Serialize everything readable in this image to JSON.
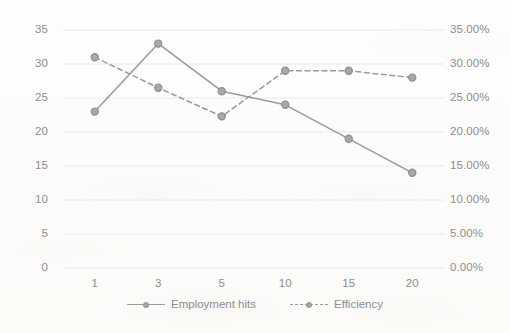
{
  "chart_data": {
    "type": "line",
    "title": "",
    "xlabel": "",
    "ylabel": "",
    "categories": [
      "1",
      "3",
      "5",
      "10",
      "15",
      "20"
    ],
    "series": [
      {
        "name": "Employment hits",
        "axis": "left",
        "style": "solid",
        "marker": "circle",
        "color": "#9a9a9a",
        "values": [
          23,
          33,
          26,
          24,
          19,
          14
        ]
      },
      {
        "name": "Efficiency",
        "axis": "right",
        "style": "dashed",
        "marker": "circle",
        "color": "#9a9a9a",
        "values": [
          31.0,
          26.5,
          22.3,
          29.0,
          29.0,
          28.0
        ]
      }
    ],
    "y_left": {
      "min": 0,
      "max": 35,
      "step": 5,
      "ticks": [
        "0",
        "5",
        "10",
        "15",
        "20",
        "25",
        "30",
        "35"
      ]
    },
    "y_right": {
      "min": 0,
      "max": 35,
      "step": 5,
      "ticks": [
        "0.00%",
        "5.00%",
        "10.00%",
        "15.00%",
        "20.00%",
        "25.00%",
        "30.00%",
        "35.00%"
      ]
    },
    "grid": {
      "horizontal": true,
      "vertical": false,
      "color": "#e8e8e6"
    },
    "legend": {
      "position": "bottom-center",
      "entries": [
        "Employment hits",
        "Efficiency"
      ]
    }
  },
  "legend": {
    "employment_label": "Employment hits",
    "efficiency_label": "Efficiency"
  }
}
